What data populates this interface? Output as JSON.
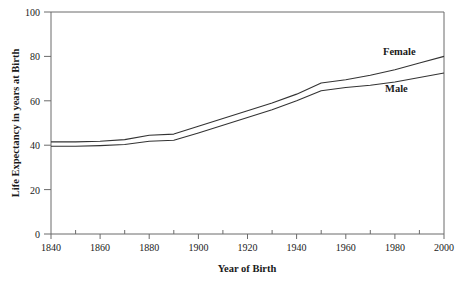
{
  "chart_data": {
    "type": "line",
    "title": "",
    "xlabel": "Year of Birth",
    "ylabel": "Life Expectancy in years at Birth",
    "xlim": [
      1840,
      2000
    ],
    "ylim": [
      0,
      100
    ],
    "x_ticks_major": [
      1840,
      1860,
      1880,
      1900,
      1920,
      1940,
      1960,
      1980,
      2000
    ],
    "x_ticks_minor": [
      1850,
      1870,
      1890,
      1910,
      1930,
      1950,
      1970,
      1990
    ],
    "y_ticks_major": [
      0,
      20,
      40,
      60,
      80,
      100
    ],
    "x_tick_labels": [
      "1840",
      "1860",
      "1880",
      "1900",
      "1920",
      "1940",
      "1960",
      "1980",
      "2000"
    ],
    "y_tick_labels": [
      "0",
      "20",
      "40",
      "60",
      "80",
      "100"
    ],
    "grid": false,
    "legend_position": "inline-right",
    "x": [
      1840,
      1850,
      1860,
      1870,
      1880,
      1890,
      1900,
      1910,
      1920,
      1930,
      1940,
      1950,
      1960,
      1970,
      1980,
      1990,
      2000
    ],
    "series": [
      {
        "name": "Female",
        "color": "#333333",
        "values": [
          41.5,
          41.5,
          41.8,
          42.5,
          44.5,
          45.0,
          48.5,
          52.0,
          55.5,
          59.0,
          63.0,
          68.0,
          69.5,
          71.5,
          74.0,
          77.0,
          80.0
        ]
      },
      {
        "name": "Male",
        "color": "#333333",
        "values": [
          39.5,
          39.5,
          39.8,
          40.3,
          41.8,
          42.2,
          45.5,
          49.0,
          52.5,
          56.0,
          60.0,
          64.5,
          66.0,
          67.0,
          68.5,
          70.5,
          72.5
        ]
      }
    ]
  },
  "axes": {
    "x_title": "Year of Birth",
    "y_title": "Life Expectancy in years at Birth"
  },
  "labels": {
    "female": "Female",
    "male": "Male"
  },
  "ticks": {
    "y": [
      "100",
      "80",
      "60",
      "40",
      "20",
      "0"
    ],
    "x": [
      "1840",
      "1860",
      "1880",
      "1900",
      "1920",
      "1940",
      "1960",
      "1980",
      "2000"
    ]
  },
  "colors": {
    "line": "#333333",
    "axis": "#4d4d4d",
    "text": "#1a1a1a",
    "background": "#ffffff"
  }
}
